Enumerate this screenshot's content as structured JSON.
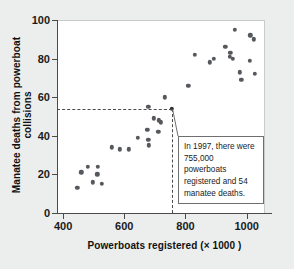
{
  "chart_data": {
    "type": "scatter",
    "title": "",
    "xlabel": "Powerboats registered (× 1000 )",
    "ylabel": "Manatee deaths from powerboat collisions",
    "xlim": [
      380,
      1060
    ],
    "ylim": [
      0,
      100
    ],
    "xticks": [
      400,
      600,
      800,
      1000
    ],
    "yticks": [
      0,
      20,
      40,
      60,
      80,
      100
    ],
    "grid": false,
    "legend": null,
    "x": [
      447,
      460,
      481,
      498,
      513,
      512,
      526,
      559,
      585,
      614,
      645,
      675,
      711,
      719,
      681,
      679,
      678,
      696,
      713,
      732,
      755,
      809,
      830,
      880,
      944,
      962,
      978,
      983,
      1010,
      1024,
      1027,
      1010,
      930,
      946,
      893,
      955
    ],
    "y": [
      13,
      21,
      24,
      16,
      24,
      20,
      15,
      34,
      33,
      33,
      39,
      43,
      42,
      47,
      35,
      38,
      55,
      49,
      48,
      60,
      54,
      66,
      82,
      78,
      81,
      95,
      73,
      69,
      79,
      92,
      90,
      83,
      86,
      81,
      80,
      80
    ],
    "points": [
      {
        "x": 447,
        "y": 13
      },
      {
        "x": 460,
        "y": 21
      },
      {
        "x": 481,
        "y": 24
      },
      {
        "x": 498,
        "y": 16
      },
      {
        "x": 513,
        "y": 24
      },
      {
        "x": 512,
        "y": 20
      },
      {
        "x": 526,
        "y": 15
      },
      {
        "x": 559,
        "y": 34
      },
      {
        "x": 585,
        "y": 33
      },
      {
        "x": 614,
        "y": 33
      },
      {
        "x": 645,
        "y": 39
      },
      {
        "x": 675,
        "y": 43
      },
      {
        "x": 678,
        "y": 55
      },
      {
        "x": 679,
        "y": 38
      },
      {
        "x": 681,
        "y": 35
      },
      {
        "x": 696,
        "y": 49
      },
      {
        "x": 711,
        "y": 42
      },
      {
        "x": 713,
        "y": 48
      },
      {
        "x": 719,
        "y": 47
      },
      {
        "x": 732,
        "y": 60
      },
      {
        "x": 755,
        "y": 54,
        "highlight": true
      },
      {
        "x": 809,
        "y": 66
      },
      {
        "x": 830,
        "y": 82
      },
      {
        "x": 880,
        "y": 78
      },
      {
        "x": 893,
        "y": 80
      },
      {
        "x": 930,
        "y": 86
      },
      {
        "x": 944,
        "y": 81
      },
      {
        "x": 946,
        "y": 83
      },
      {
        "x": 955,
        "y": 80
      },
      {
        "x": 962,
        "y": 95
      },
      {
        "x": 978,
        "y": 73
      },
      {
        "x": 983,
        "y": 69
      },
      {
        "x": 1010,
        "y": 79
      },
      {
        "x": 1012,
        "y": 92
      },
      {
        "x": 1024,
        "y": 90
      },
      {
        "x": 1027,
        "y": 72
      }
    ],
    "reference_lines": {
      "x_value": 755,
      "y_value": 54,
      "style": "dashed"
    },
    "annotation": {
      "text": "In 1997, there were 755,000 powerboats registered and 54 manatee deaths.",
      "target_x": 755,
      "target_y": 54
    }
  },
  "colors": {
    "figure_background": "#eceded",
    "plot_background": "#ffffff",
    "point": "#55585c",
    "axis": "#4a4a4a",
    "text": "#1b1b1b",
    "annotation_border": "#6d6f71"
  }
}
